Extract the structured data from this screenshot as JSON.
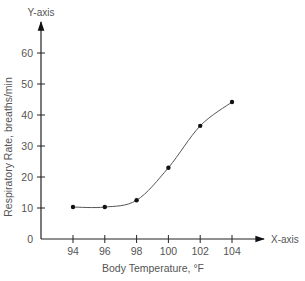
{
  "chart_data": {
    "type": "line",
    "title": "",
    "xlabel": "Body Temperature, °F",
    "ylabel": "Respiratory Rate, breaths/min",
    "x_axis_tag": "X-axis",
    "y_axis_tag": "Y-axis",
    "x": [
      94,
      96,
      98,
      100,
      102,
      104
    ],
    "series": [
      {
        "name": "Respiratory Rate",
        "values": [
          10.3,
          10.3,
          12.5,
          23,
          36.5,
          44.2
        ]
      }
    ],
    "x_ticks": [
      "94",
      "96",
      "98",
      "100",
      "102",
      "104"
    ],
    "y_ticks": [
      "0",
      "10",
      "20",
      "30",
      "40",
      "50",
      "60"
    ],
    "xlim": [
      92,
      106
    ],
    "ylim": [
      0,
      70
    ],
    "grid": false,
    "legend": "none",
    "smooth": true,
    "markers": true
  },
  "colors": {
    "axis": "#222222",
    "line": "#555555",
    "marker": "#111111",
    "text": "#555555"
  }
}
